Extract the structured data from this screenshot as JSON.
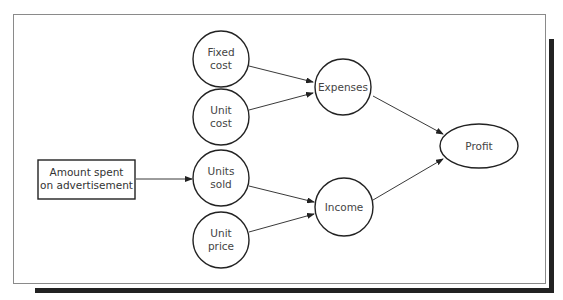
{
  "diagram": {
    "nodes": [
      {
        "id": "fixed_cost",
        "label": "Fixed\ncost",
        "shape": "circle"
      },
      {
        "id": "unit_cost",
        "label": "Unit\ncost",
        "shape": "circle"
      },
      {
        "id": "amount_spent",
        "label": "Amount spent\non advertisement",
        "shape": "rectangle"
      },
      {
        "id": "units_sold",
        "label": "Units\nsold",
        "shape": "circle"
      },
      {
        "id": "unit_price",
        "label": "Unit\nprice",
        "shape": "circle"
      },
      {
        "id": "expenses",
        "label": "Expenses",
        "shape": "circle"
      },
      {
        "id": "income",
        "label": "Income",
        "shape": "circle"
      },
      {
        "id": "profit",
        "label": "Profit",
        "shape": "ellipse"
      }
    ],
    "edges": [
      {
        "from": "fixed_cost",
        "to": "expenses"
      },
      {
        "from": "unit_cost",
        "to": "expenses"
      },
      {
        "from": "amount_spent",
        "to": "units_sold"
      },
      {
        "from": "units_sold",
        "to": "income"
      },
      {
        "from": "unit_price",
        "to": "income"
      },
      {
        "from": "expenses",
        "to": "profit"
      },
      {
        "from": "income",
        "to": "profit"
      }
    ],
    "colors": {
      "stroke": "#222222",
      "frame": "#8a8a8a",
      "shadow": "#222222",
      "text": "#444444"
    }
  }
}
